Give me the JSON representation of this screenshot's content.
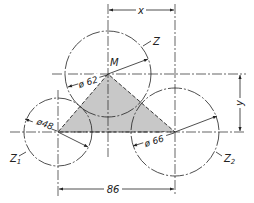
{
  "diagram": {
    "type": "technical-drawing",
    "colors": {
      "line": "#222222",
      "fill": "#c8c8c8",
      "background": "#ffffff"
    },
    "points": {
      "M": {
        "label": "M",
        "cx": 108,
        "cy": 74
      },
      "Z1": {
        "cx": 58,
        "cy": 132
      },
      "Z2": {
        "cx": 175,
        "cy": 132
      }
    },
    "circles": [
      {
        "id": "Z",
        "label": "Z",
        "diameter_label": "ø 62",
        "r": 43
      },
      {
        "id": "Z1",
        "label": "Z",
        "label_sub": "1",
        "diameter_label": "ø48",
        "r": 34
      },
      {
        "id": "Z2",
        "label": "Z",
        "label_sub": "2",
        "diameter_label": "ø 66",
        "r": 44
      }
    ],
    "dimensions": {
      "x": {
        "label": "x"
      },
      "y": {
        "label": "y"
      },
      "base": {
        "label": "86"
      }
    }
  }
}
